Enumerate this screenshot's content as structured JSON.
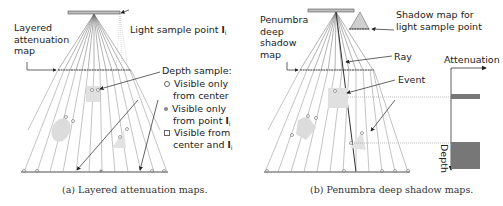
{
  "panel_a": {
    "title_label": "Layered attenuation map",
    "title_lines": [
      "Layered",
      "attenuation",
      "map"
    ],
    "light_sample_label": "Light sample point",
    "light_symbol": "l",
    "light_subscript": "i",
    "depth_sample_header": "Depth sample:",
    "legend": [
      {
        "marker": "hollow-circle",
        "lines": [
          "Visible only",
          "from center"
        ]
      },
      {
        "marker": "filled-circle",
        "lines": [
          "Visible only",
          "from point"
        ],
        "has_symbol": true
      },
      {
        "marker": "hollow-square",
        "lines": [
          "Visible from",
          "center and"
        ],
        "has_symbol": true
      }
    ],
    "caption": "(a) Layered attenuation maps."
  },
  "panel_b": {
    "title_lines": [
      "Penumbra",
      "deep",
      "shadow",
      "map"
    ],
    "shadow_map_lines": [
      "Shadow map for",
      "light sample point"
    ],
    "ray_label": "Ray",
    "event_label": "Event",
    "attenuation_axis_label": "Attenuation",
    "depth_axis_label": "Depth",
    "caption": "(b) Penumbra deep shadow maps."
  },
  "colors": {
    "line": "#555555",
    "light_line": "#bbbbbb",
    "occluder": "#d9d9d9",
    "bar_fill": "#777777",
    "text": "#222222"
  }
}
